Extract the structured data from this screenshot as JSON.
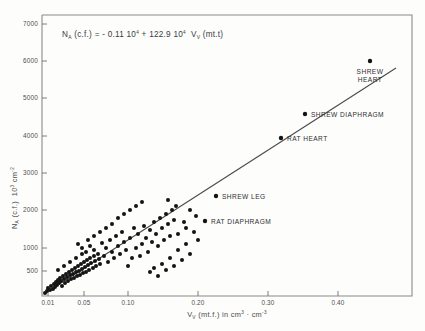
{
  "figure": {
    "equation": {
      "var_y": "N",
      "var_y_sub": "A",
      "y_arg": "(c.f.)",
      "equals": "=",
      "intercept": "- 0.11",
      "intercept_mult": "10",
      "intercept_exp": "4",
      "plus": "+",
      "slope": "122.9",
      "slope_mult": "10",
      "slope_exp": "4",
      "var_x": "V",
      "var_x_sub": "V",
      "x_arg": "(mt.t)",
      "full_text": "N_A (c.f.) = - 0.11 10^4 + 122.9 10^4 V_V (mt.t)"
    }
  },
  "chart_data": {
    "type": "scatter",
    "title": "",
    "xlabel": "V_V (mt.f.) in cm3 · cm-3",
    "ylabel": "N_A (c.f.)  10^3 cm^-2",
    "xlabel_parts": {
      "v": "V",
      "v_sub": "V",
      "arg": "(mt.f.)",
      "in": "in",
      "unit_a": "cm",
      "unit_a_exp": "3",
      "dot": "·",
      "unit_b": "cm",
      "unit_b_exp": "-3"
    },
    "ylabel_parts": {
      "n": "N",
      "n_sub": "A",
      "arg": "(c.f.)",
      "mult": "10",
      "mult_exp": "3",
      "unit": "cm",
      "unit_exp": "-2"
    },
    "grid": false,
    "legend": "none",
    "xlim": [
      0.0,
      0.47
    ],
    "ylim": [
      0,
      7400
    ],
    "xticks": [
      {
        "value": 0.01,
        "label": "0.01",
        "px": 48
      },
      {
        "value": 0.05,
        "label": "0.05",
        "px": 84
      },
      {
        "value": 0.1,
        "label": "0.10",
        "px": 128
      },
      {
        "value": 0.2,
        "label": "0.20",
        "px": 198
      },
      {
        "value": 0.3,
        "label": "0.30",
        "px": 268
      },
      {
        "value": 0.4,
        "label": "0.40",
        "px": 338
      }
    ],
    "yticks": [
      {
        "value": 7000,
        "label": "7000",
        "px": 24
      },
      {
        "value": 6000,
        "label": "6000",
        "px": 61
      },
      {
        "value": 5000,
        "label": "5000",
        "px": 98
      },
      {
        "value": 4000,
        "label": "4000",
        "px": 136
      },
      {
        "value": 3000,
        "label": "3000",
        "px": 173
      },
      {
        "value": 2000,
        "label": "2000",
        "px": 210
      },
      {
        "value": 1000,
        "label": "1000",
        "px": 248
      },
      {
        "value": 500,
        "label": "500",
        "px": 271
      }
    ],
    "regression": {
      "intercept": -1100,
      "slope": 1229000,
      "x_start": 0.012,
      "y_start": 330,
      "x_end": 0.445,
      "y_end": 6500,
      "px_x1": 50,
      "px_y1": 290,
      "px_x2": 396,
      "px_y2": 68
    },
    "labeled_points": [
      {
        "name": "SHREW HEART",
        "label_lines": [
          "SHREW",
          "HEART"
        ],
        "x": 0.445,
        "y": 6400,
        "px": [
          370,
          61
        ],
        "label_px": [
          370,
          74
        ],
        "label_align": "middle"
      },
      {
        "name": "SHREW DIAPHRAGM",
        "label_lines": [
          "SHREW  DIAPHRAGM"
        ],
        "x": 0.315,
        "y": 4700,
        "px": [
          305,
          114
        ],
        "label_px": [
          311,
          117
        ],
        "label_align": "start"
      },
      {
        "name": "RAT HEART",
        "label_lines": [
          "RAT  HEART"
        ],
        "x": 0.272,
        "y": 4000,
        "px": [
          281,
          138
        ],
        "label_px": [
          287,
          141
        ],
        "label_align": "start"
      },
      {
        "name": "SHREW LEG",
        "label_lines": [
          "SHREW  LEG"
        ],
        "x": 0.205,
        "y": 2450,
        "px": [
          216,
          196
        ],
        "label_px": [
          222,
          199
        ],
        "label_align": "start"
      },
      {
        "name": "RAT DIAPHRAGM",
        "label_lines": [
          "RAT  DIAPHRAGM"
        ],
        "x": 0.182,
        "y": 1800,
        "px": [
          205,
          221
        ],
        "label_px": [
          211,
          224
        ],
        "label_align": "start"
      }
    ],
    "cluster_points": [
      [
        45,
        293
      ],
      [
        47,
        291
      ],
      [
        48,
        288
      ],
      [
        50,
        290
      ],
      [
        51,
        286
      ],
      [
        53,
        289
      ],
      [
        54,
        284
      ],
      [
        55,
        287
      ],
      [
        56,
        282
      ],
      [
        57,
        285
      ],
      [
        58,
        280
      ],
      [
        59,
        283
      ],
      [
        60,
        278
      ],
      [
        61,
        281
      ],
      [
        62,
        286
      ],
      [
        63,
        276
      ],
      [
        64,
        279
      ],
      [
        65,
        283
      ],
      [
        66,
        274
      ],
      [
        67,
        277
      ],
      [
        68,
        281
      ],
      [
        69,
        272
      ],
      [
        70,
        275
      ],
      [
        71,
        279
      ],
      [
        72,
        270
      ],
      [
        73,
        274
      ],
      [
        74,
        278
      ],
      [
        75,
        268
      ],
      [
        76,
        272
      ],
      [
        77,
        276
      ],
      [
        78,
        266
      ],
      [
        79,
        271
      ],
      [
        80,
        275
      ],
      [
        81,
        264
      ],
      [
        82,
        269
      ],
      [
        83,
        273
      ],
      [
        84,
        262
      ],
      [
        85,
        267
      ],
      [
        86,
        272
      ],
      [
        87,
        260
      ],
      [
        88,
        265
      ],
      [
        89,
        270
      ],
      [
        90,
        258
      ],
      [
        91,
        263
      ],
      [
        93,
        268
      ],
      [
        94,
        256
      ],
      [
        95,
        261
      ],
      [
        96,
        266
      ],
      [
        78,
        244
      ],
      [
        82,
        248
      ],
      [
        86,
        252
      ],
      [
        90,
        246
      ],
      [
        94,
        250
      ],
      [
        98,
        254
      ],
      [
        99,
        259
      ],
      [
        100,
        264
      ],
      [
        102,
        243
      ],
      [
        104,
        256
      ],
      [
        106,
        248
      ],
      [
        108,
        262
      ],
      [
        110,
        240
      ],
      [
        112,
        252
      ],
      [
        114,
        258
      ],
      [
        116,
        236
      ],
      [
        118,
        246
      ],
      [
        120,
        254
      ],
      [
        122,
        232
      ],
      [
        124,
        242
      ],
      [
        126,
        250
      ],
      [
        128,
        266
      ],
      [
        130,
        238
      ],
      [
        132,
        258
      ],
      [
        134,
        228
      ],
      [
        136,
        248
      ],
      [
        138,
        234
      ],
      [
        140,
        256
      ],
      [
        142,
        244
      ],
      [
        144,
        226
      ],
      [
        146,
        238
      ],
      [
        148,
        252
      ],
      [
        150,
        230
      ],
      [
        152,
        242
      ],
      [
        154,
        222
      ],
      [
        156,
        234
      ],
      [
        158,
        246
      ],
      [
        160,
        218
      ],
      [
        162,
        228
      ],
      [
        164,
        240
      ],
      [
        166,
        214
      ],
      [
        168,
        224
      ],
      [
        170,
        236
      ],
      [
        172,
        210
      ],
      [
        174,
        220
      ],
      [
        150,
        272
      ],
      [
        154,
        268
      ],
      [
        158,
        276
      ],
      [
        162,
        264
      ],
      [
        166,
        270
      ],
      [
        170,
        258
      ],
      [
        174,
        266
      ],
      [
        178,
        250
      ],
      [
        182,
        260
      ],
      [
        186,
        244
      ],
      [
        190,
        254
      ],
      [
        194,
        232
      ],
      [
        198,
        240
      ],
      [
        186,
        228
      ],
      [
        178,
        234
      ],
      [
        190,
        210
      ],
      [
        196,
        216
      ],
      [
        184,
        222
      ],
      [
        176,
        206
      ],
      [
        168,
        200
      ],
      [
        106,
        228
      ],
      [
        112,
        224
      ],
      [
        100,
        232
      ],
      [
        94,
        236
      ],
      [
        88,
        240
      ],
      [
        118,
        218
      ],
      [
        124,
        214
      ],
      [
        130,
        210
      ],
      [
        136,
        206
      ],
      [
        142,
        202
      ],
      [
        82,
        254
      ],
      [
        76,
        258
      ],
      [
        70,
        262
      ],
      [
        64,
        266
      ],
      [
        58,
        270
      ]
    ]
  }
}
